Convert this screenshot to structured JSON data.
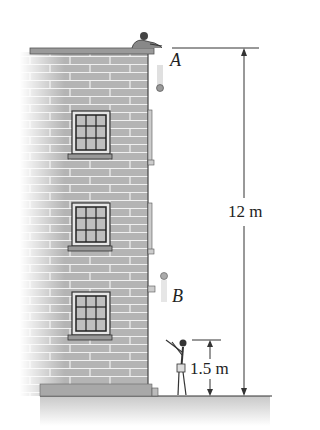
{
  "figure": {
    "point_a_label": "A",
    "point_b_label": "B",
    "height_total_label": "12 m",
    "height_catch_label": "1.5 m"
  },
  "colors": {
    "brick": "#a9a9a9",
    "mortar": "#f2f2f2",
    "outline": "#444444",
    "ground": "#d0d0d0",
    "line": "#333333"
  },
  "windows": [
    {
      "top": 110
    },
    {
      "top": 205
    },
    {
      "top": 290
    }
  ]
}
